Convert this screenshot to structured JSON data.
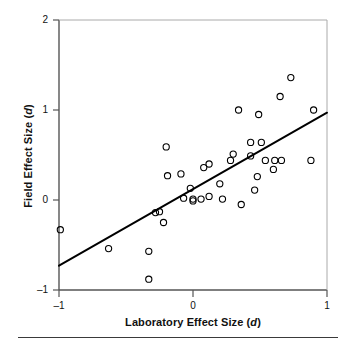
{
  "chart_data": {
    "type": "scatter",
    "title": "",
    "xlabel": "Laboratory Effect Size (d)",
    "ylabel": "Field Effect Size (d)",
    "xlabel_prefix": "Laboratory Effect Size (",
    "xlabel_italic": "d",
    "xlabel_suffix": ")",
    "ylabel_prefix": "Field Effect Size (",
    "ylabel_italic": "d",
    "ylabel_suffix": ")",
    "xlim": [
      -1,
      1
    ],
    "ylim": [
      -1,
      2
    ],
    "xticks": [
      -1,
      0,
      1
    ],
    "xticklabels": [
      "–1",
      "0",
      "1"
    ],
    "yticks": [
      -1,
      0,
      1,
      2
    ],
    "yticklabels": [
      "–1",
      "0",
      "1",
      "2"
    ],
    "grid": false,
    "legend": false,
    "marker": "open-circle",
    "marker_color": "#000000",
    "line_color": "#000000",
    "axis_color": "#555555",
    "points": [
      {
        "x": -0.99,
        "y": -0.33
      },
      {
        "x": -0.63,
        "y": -0.54
      },
      {
        "x": -0.33,
        "y": -0.57
      },
      {
        "x": -0.33,
        "y": -0.88
      },
      {
        "x": -0.28,
        "y": -0.14
      },
      {
        "x": -0.25,
        "y": -0.13
      },
      {
        "x": -0.22,
        "y": -0.25
      },
      {
        "x": -0.2,
        "y": 0.59
      },
      {
        "x": -0.19,
        "y": 0.27
      },
      {
        "x": -0.09,
        "y": 0.29
      },
      {
        "x": -0.07,
        "y": 0.02
      },
      {
        "x": -0.02,
        "y": 0.13
      },
      {
        "x": 0.0,
        "y": -0.01
      },
      {
        "x": 0.0,
        "y": 0.01
      },
      {
        "x": 0.06,
        "y": 0.01
      },
      {
        "x": 0.08,
        "y": 0.36
      },
      {
        "x": 0.12,
        "y": 0.4
      },
      {
        "x": 0.12,
        "y": 0.04
      },
      {
        "x": 0.2,
        "y": 0.18
      },
      {
        "x": 0.22,
        "y": 0.01
      },
      {
        "x": 0.28,
        "y": 0.44
      },
      {
        "x": 0.3,
        "y": 0.51
      },
      {
        "x": 0.34,
        "y": 1.0
      },
      {
        "x": 0.36,
        "y": -0.05
      },
      {
        "x": 0.43,
        "y": 0.49
      },
      {
        "x": 0.43,
        "y": 0.64
      },
      {
        "x": 0.46,
        "y": 0.11
      },
      {
        "x": 0.48,
        "y": 0.26
      },
      {
        "x": 0.49,
        "y": 0.95
      },
      {
        "x": 0.51,
        "y": 0.64
      },
      {
        "x": 0.54,
        "y": 0.44
      },
      {
        "x": 0.6,
        "y": 0.34
      },
      {
        "x": 0.61,
        "y": 0.44
      },
      {
        "x": 0.65,
        "y": 1.15
      },
      {
        "x": 0.66,
        "y": 0.44
      },
      {
        "x": 0.73,
        "y": 1.36
      },
      {
        "x": 0.9,
        "y": 1.0
      },
      {
        "x": 0.88,
        "y": 0.44
      }
    ],
    "regression_line": {
      "x0": -1.0,
      "y0": -0.73,
      "x1": 1.0,
      "y1": 0.97
    }
  }
}
